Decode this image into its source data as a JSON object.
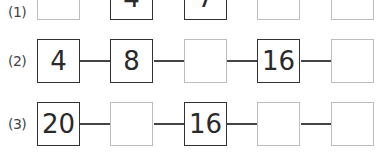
{
  "problems": [
    {
      "label": "(1)",
      "connectors": false,
      "boxes": [
        {
          "value": "",
          "filled": false
        },
        {
          "value": "4",
          "filled": true
        },
        {
          "value": "7",
          "filled": true
        },
        {
          "value": "",
          "filled": false
        },
        {
          "value": "",
          "filled": false
        }
      ]
    },
    {
      "label": "(2)",
      "connectors": true,
      "boxes": [
        {
          "value": "4",
          "filled": true
        },
        {
          "value": "8",
          "filled": true
        },
        {
          "value": "",
          "filled": false
        },
        {
          "value": "16",
          "filled": true
        },
        {
          "value": "",
          "filled": false
        }
      ]
    },
    {
      "label": "(3)",
      "connectors": true,
      "boxes": [
        {
          "value": "20",
          "filled": true
        },
        {
          "value": "",
          "filled": false
        },
        {
          "value": "16",
          "filled": true
        },
        {
          "value": "",
          "filled": false
        },
        {
          "value": "",
          "filled": false
        }
      ]
    }
  ],
  "colors": {
    "filled_border": "#333333",
    "empty_border": "#bdbdbd",
    "connector": "#444444",
    "text": "#2a2a2a"
  }
}
